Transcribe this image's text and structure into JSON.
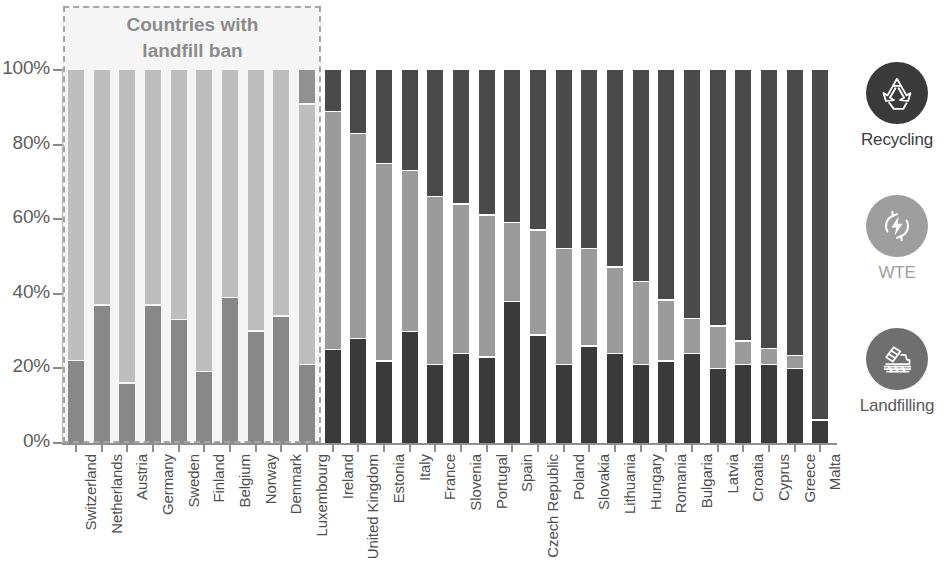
{
  "annotation": {
    "line1": "Countries with",
    "line2": "landfill ban",
    "covers_through": "Luxembourg"
  },
  "legend": {
    "items": [
      {
        "label": "Recycling",
        "icon": "recycle-icon",
        "color": "#3a3a3a"
      },
      {
        "label": "WTE",
        "icon": "energy-bolt-icon",
        "color": "#9e9e9e"
      },
      {
        "label": "Landfilling",
        "icon": "bulldozer-icon",
        "color": "#6f6f6f"
      }
    ]
  },
  "chart_data": {
    "type": "bar",
    "stacked": true,
    "title": "",
    "xlabel": "",
    "ylabel": "",
    "ylim": [
      0,
      100
    ],
    "ytick_labels": [
      "0%",
      "20%",
      "40%",
      "60%",
      "80%",
      "100%"
    ],
    "ytick_values": [
      0,
      20,
      40,
      60,
      80,
      100
    ],
    "grid": false,
    "legend_position": "right",
    "colors": {
      "recycling": "#3a3a3a",
      "wte": "#9b9b9b",
      "landfilling": "#4a4a4a"
    },
    "categories": [
      "Switzerland",
      "Netherlands",
      "Austria",
      "Germany",
      "Sweden",
      "Finland",
      "Belgium",
      "Norway",
      "Denmark",
      "Luxembourg",
      "Ireland",
      "United Kingdom",
      "Estonia",
      "Italy",
      "France",
      "Slovenia",
      "Portugal",
      "Spain",
      "Czech Republic",
      "Poland",
      "Slovakia",
      "Lithuania",
      "Hungary",
      "Romania",
      "Bulgaria",
      "Latvia",
      "Croatia",
      "Cyprus",
      "Greece",
      "Malta"
    ],
    "series": [
      {
        "name": "Recycling",
        "values": [
          22,
          37,
          16,
          37,
          33,
          19,
          39,
          30,
          34,
          21,
          25,
          28,
          22,
          30,
          21,
          24,
          23,
          38,
          29,
          21,
          26,
          24,
          21,
          22,
          24,
          20,
          21,
          21,
          20,
          6
        ]
      },
      {
        "name": "WTE",
        "values": [
          78,
          63,
          84,
          63,
          67,
          81,
          61,
          70,
          66,
          70,
          64,
          55,
          53,
          43,
          45,
          40,
          38,
          21,
          28,
          31,
          26,
          23,
          22,
          16,
          9,
          11,
          6,
          4,
          3,
          0
        ]
      },
      {
        "name": "Landfilling",
        "values": [
          0,
          0,
          0,
          0,
          0,
          0,
          0,
          0,
          0,
          9,
          11,
          17,
          25,
          27,
          34,
          36,
          39,
          41,
          43,
          48,
          48,
          53,
          57,
          62,
          67,
          69,
          73,
          75,
          77,
          94
        ]
      }
    ]
  }
}
